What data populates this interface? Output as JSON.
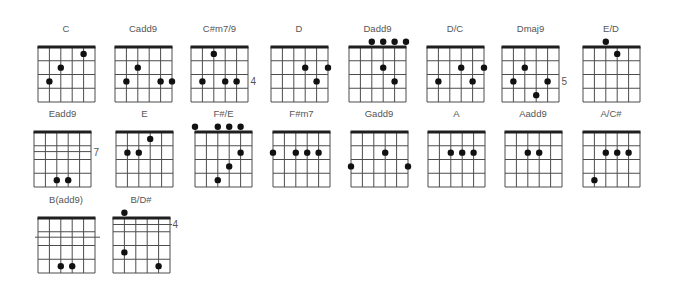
{
  "colors": {
    "grid": "#4d4d4d",
    "nut": "#1f1f1f",
    "dot": "#111111",
    "label": "#555555"
  },
  "diagram": {
    "strings": 6,
    "frets": 4,
    "width": 57,
    "height": 55
  },
  "chords": [
    {
      "name": "C",
      "x": 37.5,
      "y": 47,
      "dots": [
        [
          4,
          1
        ],
        [
          2,
          2
        ],
        [
          1,
          3
        ]
      ]
    },
    {
      "name": "Cadd9",
      "x": 114.5,
      "y": 47,
      "dots": [
        [
          2,
          2
        ],
        [
          1,
          3
        ],
        [
          4,
          3
        ],
        [
          5,
          3
        ]
      ]
    },
    {
      "name": "C#m7/9",
      "x": 191,
      "y": 47,
      "dots": [
        [
          2,
          1
        ],
        [
          1,
          3
        ],
        [
          3,
          3
        ],
        [
          4,
          3
        ]
      ],
      "fret_label": {
        "text": "4",
        "row": 3
      }
    },
    {
      "name": "D",
      "x": 270.5,
      "y": 47,
      "dots": [
        [
          3,
          2
        ],
        [
          5,
          2
        ],
        [
          4,
          3
        ]
      ]
    },
    {
      "name": "Dadd9",
      "x": 349,
      "y": 47,
      "dots": [
        [
          2,
          0
        ],
        [
          3,
          0
        ],
        [
          4,
          0
        ],
        [
          5,
          0
        ],
        [
          3,
          2
        ],
        [
          4,
          3
        ]
      ]
    },
    {
      "name": "D/C",
      "x": 426.5,
      "y": 47,
      "dots": [
        [
          3,
          2
        ],
        [
          5,
          2
        ],
        [
          1,
          3
        ],
        [
          4,
          3
        ]
      ]
    },
    {
      "name": "Dmaj9",
      "x": 502,
      "y": 47,
      "dots": [
        [
          2,
          2
        ],
        [
          1,
          3
        ],
        [
          4,
          3
        ],
        [
          3,
          4
        ]
      ],
      "fret_label": {
        "text": "5",
        "row": 3
      }
    },
    {
      "name": "E/D",
      "x": 582.5,
      "y": 47,
      "dots": [
        [
          2,
          0
        ],
        [
          3,
          1
        ]
      ]
    },
    {
      "name": "Eadd9",
      "x": 34,
      "y": 131.5,
      "dots": [
        [
          2,
          4
        ],
        [
          3,
          4
        ]
      ],
      "fret_label": {
        "text": "7",
        "row": 2
      },
      "extra_lines": [
        {
          "y": 19.6,
          "x1": 0,
          "x2": 57
        }
      ]
    },
    {
      "name": "E",
      "x": 116,
      "y": 131.5,
      "dots": [
        [
          3,
          1
        ],
        [
          1,
          2
        ],
        [
          2,
          2
        ]
      ]
    },
    {
      "name": "F#/E",
      "x": 195,
      "y": 131.5,
      "dots": [
        [
          0,
          0
        ],
        [
          2,
          0
        ],
        [
          3,
          0
        ],
        [
          4,
          0
        ],
        [
          4,
          2
        ],
        [
          3,
          3
        ],
        [
          2,
          4
        ]
      ]
    },
    {
      "name": "F#m7",
      "x": 273,
      "y": 131.5,
      "dots": [
        [
          0,
          2
        ],
        [
          2,
          2
        ],
        [
          3,
          2
        ],
        [
          4,
          2
        ]
      ]
    },
    {
      "name": "Gadd9",
      "x": 350.5,
      "y": 131.5,
      "dots": [
        [
          3,
          2
        ],
        [
          0,
          3
        ],
        [
          5,
          3
        ]
      ]
    },
    {
      "name": "A",
      "x": 428,
      "y": 131.5,
      "dots": [
        [
          2,
          2
        ],
        [
          3,
          2
        ],
        [
          4,
          2
        ]
      ]
    },
    {
      "name": "Aadd9",
      "x": 504.5,
      "y": 131.5,
      "dots": [
        [
          2,
          2
        ],
        [
          3,
          2
        ]
      ]
    },
    {
      "name": "A/C#",
      "x": 582.5,
      "y": 131.5,
      "dots": [
        [
          2,
          2
        ],
        [
          3,
          2
        ],
        [
          4,
          2
        ],
        [
          1,
          4
        ]
      ]
    },
    {
      "name": "B(add9)",
      "x": 37.5,
      "y": 217.5,
      "dots": [
        [
          2,
          4
        ],
        [
          3,
          4
        ]
      ],
      "extra_lines": [
        {
          "y": 19.2,
          "x1": -3,
          "x2": 62
        }
      ]
    },
    {
      "name": "B/D#",
      "x": 112.5,
      "y": 217.5,
      "dots": [
        [
          1,
          0
        ],
        [
          1,
          3
        ],
        [
          4,
          4
        ]
      ],
      "fret_label": {
        "text": "4",
        "row": 1
      },
      "extra_lines": [
        {
          "y": 6.5,
          "x1": 0,
          "x2": 59
        }
      ]
    }
  ]
}
